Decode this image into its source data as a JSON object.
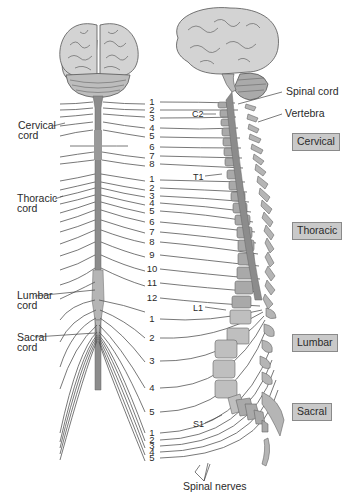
{
  "diagram": {
    "left_labels": {
      "cervical": "Cervical\ncord",
      "thoracic": "Thoracic\ncord",
      "lumbar": "Lumbar\ncord",
      "sacral": "Sacral\ncord"
    },
    "right_labels": {
      "spinal_cord": "Spinal cord",
      "vertebra": "Vertebra",
      "spinal_nerves": "Spinal nerves"
    },
    "vertebra_markers": {
      "c2": "C2",
      "t1": "T1",
      "l1": "L1",
      "s1": "S1"
    },
    "regions": {
      "cervical": "Cervical",
      "thoracic": "Thoracic",
      "lumbar": "Lumbar",
      "sacral": "Sacral"
    },
    "nerve_numbers": {
      "cervical": [
        "1",
        "2",
        "3",
        "4",
        "5",
        "6",
        "7",
        "8"
      ],
      "thoracic": [
        "1",
        "2",
        "3",
        "4",
        "5",
        "6",
        "7",
        "8",
        "9",
        "10",
        "11",
        "12"
      ],
      "lumbar": [
        "1",
        "2",
        "3",
        "4",
        "5"
      ],
      "sacral": [
        "1",
        "2",
        "3",
        "4",
        "5"
      ]
    },
    "colors": {
      "cord": "#8c8c8c",
      "cord_light": "#b5b5b5",
      "brain": "#cfcfcf",
      "bone": "#a9a9a9",
      "region_box": "#c9c9c9"
    }
  }
}
